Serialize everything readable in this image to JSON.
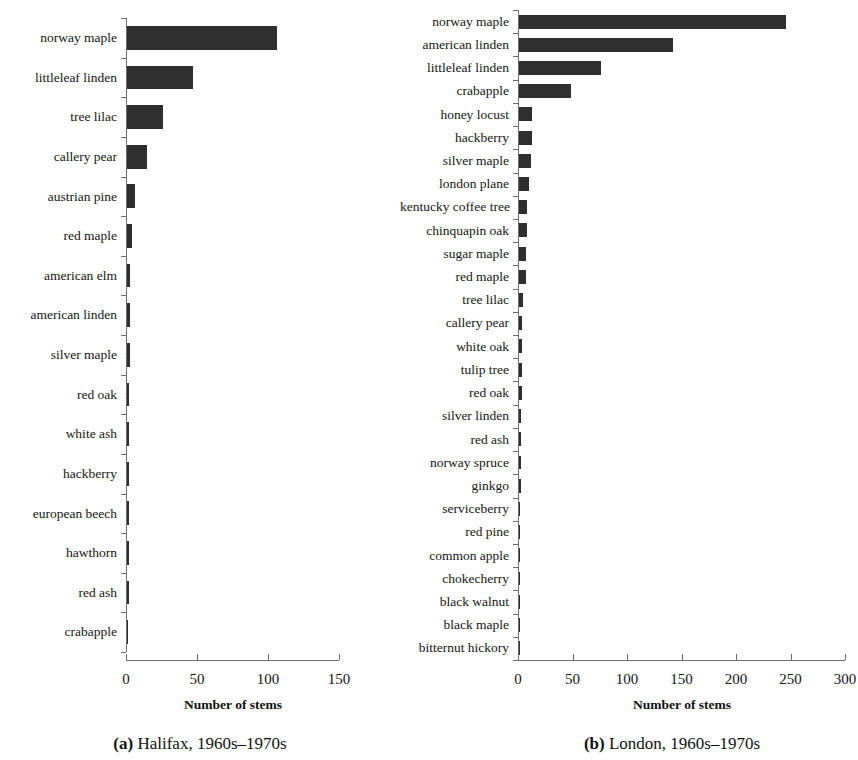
{
  "chart_data": [
    {
      "type": "bar",
      "orientation": "horizontal",
      "panel": "a",
      "panel_letter": "a",
      "caption": "Halifax, 1960s–1970s",
      "title": "",
      "xlabel": "Number of stems",
      "ylabel": "",
      "xlim": [
        0,
        150
      ],
      "xticks": [
        0,
        50,
        100,
        150
      ],
      "xticklabels": [
        "0",
        "50",
        "100",
        "150"
      ],
      "grid": false,
      "legend": false,
      "bar_color": "#2f2f2f",
      "categories": [
        "norway maple",
        "littleleaf linden",
        "tree lilac",
        "callery pear",
        "austrian pine",
        "red maple",
        "american elm",
        "american linden",
        "silver maple",
        "red oak",
        "white ash",
        "hackberry",
        "european beech",
        "hawthorn",
        "red ash",
        "crabapple"
      ],
      "values": [
        106,
        47,
        26,
        15,
        6,
        4,
        3,
        3,
        3,
        2,
        2,
        2,
        2,
        2,
        2,
        1
      ]
    },
    {
      "type": "bar",
      "orientation": "horizontal",
      "panel": "b",
      "panel_letter": "b",
      "caption": "London, 1960s–1970s",
      "title": "",
      "xlabel": "Number of stems",
      "ylabel": "",
      "xlim": [
        0,
        300
      ],
      "xticks": [
        0,
        50,
        100,
        150,
        200,
        250,
        300
      ],
      "xticklabels": [
        "0",
        "50",
        "100",
        "150",
        "200",
        "250",
        "300"
      ],
      "grid": false,
      "legend": false,
      "bar_color": "#2f2f2f",
      "categories": [
        "norway maple",
        "american linden",
        "littleleaf linden",
        "crabapple",
        "honey locust",
        "hackberry",
        "silver maple",
        "london plane",
        "kentucky coffee tree",
        "chinquapin oak",
        "sugar maple",
        "red maple",
        "tree lilac",
        "callery pear",
        "white oak",
        "tulip tree",
        "red oak",
        "silver linden",
        "red ash",
        "norway spruce",
        "ginkgo",
        "serviceberry",
        "red pine",
        "common apple",
        "chokecherry",
        "black walnut",
        "black maple",
        "bitternut hickory"
      ],
      "values": [
        246,
        142,
        76,
        49,
        13,
        13,
        12,
        10,
        8,
        8,
        7,
        7,
        5,
        4,
        4,
        4,
        4,
        3,
        3,
        3,
        3,
        2,
        2,
        2,
        2,
        2,
        2,
        2
      ]
    }
  ]
}
